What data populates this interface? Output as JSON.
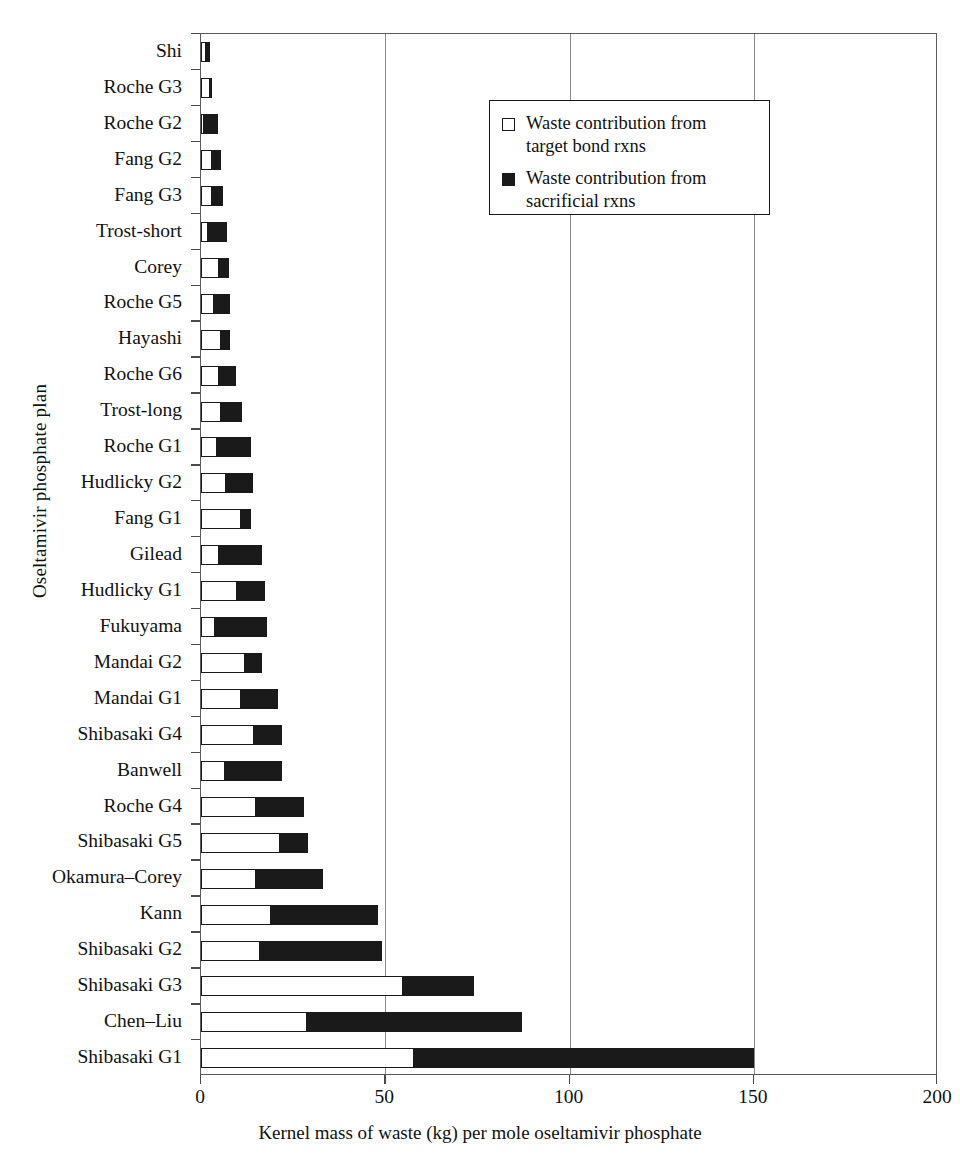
{
  "chart_data": {
    "type": "bar",
    "orientation": "horizontal",
    "stacked": true,
    "title": "",
    "xlabel": "Kernel mass of waste (kg) per mole oseltamivir phosphate",
    "ylabel": "Oseltamivir phosphate plan",
    "xlim": [
      0,
      200
    ],
    "xticks": [
      0,
      50,
      100,
      150,
      200
    ],
    "xtick_labels": [
      "0",
      "50",
      "100",
      "150",
      "200"
    ],
    "grid": "vertical",
    "legend_position": "top-right-inside",
    "categories": [
      "Shi",
      "Roche G3",
      "Roche G2",
      "Fang G2",
      "Fang G3",
      "Trost-short",
      "Corey",
      "Roche G5",
      "Hayashi",
      "Roche G6",
      "Trost-long",
      "Roche G1",
      "Hudlicky G2",
      "Fang G1",
      "Gilead",
      "Hudlicky G1",
      "Fukuyama",
      "Mandai G2",
      "Mandai G1",
      "Shibasaki G4",
      "Banwell",
      "Roche G4",
      "Shibasaki G5",
      "Okamura–Corey",
      "Kann",
      "Shibasaki G2",
      "Shibasaki G3",
      "Chen–Liu",
      "Shibasaki G1"
    ],
    "series": [
      {
        "name": "Waste contribution from target bond rxns",
        "color": "#ffffff",
        "edge_color": "#1a1a1a",
        "values": [
          1.5,
          2.5,
          1.0,
          3.0,
          3.0,
          2.0,
          5.0,
          3.5,
          5.5,
          5.0,
          5.5,
          4.5,
          7.0,
          11.0,
          5.0,
          10.0,
          4.0,
          12.0,
          11.0,
          14.5,
          6.5,
          15.0,
          21.5,
          15.0,
          19.0,
          16.0,
          55.0,
          29.0,
          58.0
        ]
      },
      {
        "name": "Waste contribution from sacrificial rxns",
        "color": "#1a1a1a",
        "edge_color": "#1a1a1a",
        "values": [
          1.0,
          0.5,
          3.5,
          2.5,
          3.0,
          5.0,
          2.5,
          4.5,
          2.5,
          4.5,
          5.5,
          9.0,
          7.0,
          2.5,
          11.5,
          7.5,
          14.0,
          4.5,
          10.0,
          7.5,
          15.5,
          13.0,
          7.5,
          18.0,
          29.0,
          33.0,
          19.0,
          58.0,
          92.0
        ]
      }
    ],
    "totals": [
      2.5,
      3.0,
      4.5,
      5.5,
      6.0,
      7.0,
      7.5,
      8.0,
      8.0,
      9.5,
      11.0,
      13.5,
      14.0,
      13.5,
      16.5,
      17.5,
      18.0,
      16.5,
      21.0,
      22.0,
      22.0,
      28.0,
      29.0,
      33.0,
      48.0,
      49.0,
      74.0,
      87.0,
      150.0
    ]
  },
  "legend": {
    "entries": [
      {
        "swatch": "open-square",
        "label": "Waste contribution from target bond rxns"
      },
      {
        "swatch": "filled-square",
        "label": "Waste contribution from sacrificial rxns"
      }
    ]
  }
}
